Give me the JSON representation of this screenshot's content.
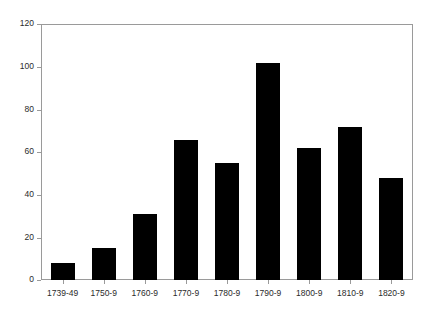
{
  "chart_data": {
    "type": "bar",
    "title": "",
    "subtitle": "",
    "xlabel": "",
    "ylabel": "",
    "categories": [
      "1739-49",
      "1750-9",
      "1760-9",
      "1770-9",
      "1780-9",
      "1790-9",
      "1800-9",
      "1810-9",
      "1820-9"
    ],
    "values": [
      8,
      15,
      31,
      66,
      55,
      102,
      62,
      72,
      48
    ],
    "ylim": [
      0,
      120
    ],
    "yticks": [
      0,
      20,
      40,
      60,
      80,
      100,
      120
    ],
    "ytick_labels": [
      "0",
      "20",
      "40",
      "60",
      "80",
      "100",
      "120"
    ],
    "grid": false,
    "legend": null,
    "bar_color": "#000000",
    "axis_color": "#9a9a9a",
    "text_color": "#2b2b2b",
    "background": "#ffffff",
    "annotations": []
  }
}
